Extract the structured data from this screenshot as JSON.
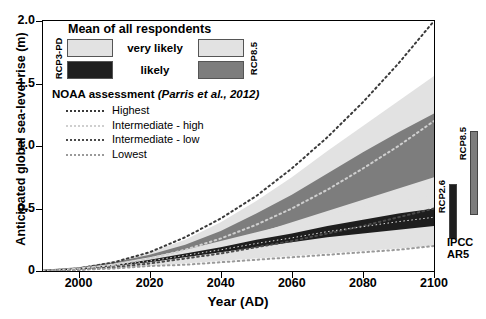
{
  "chart_data": {
    "type": "area",
    "title": "",
    "xlabel": "Year (AD)",
    "ylabel": "Anticipated global sea-level rise (m)",
    "xlim": [
      1990,
      2100
    ],
    "ylim": [
      0,
      2.0
    ],
    "xticks": [
      2000,
      2020,
      2040,
      2060,
      2080,
      2100
    ],
    "yticks": [
      0,
      0.5,
      1.0,
      1.5,
      2.0
    ],
    "ytick_labels": [
      "0",
      "0.5",
      "1.0",
      "1.5",
      "2.0"
    ],
    "xtick_labels": [
      "2000",
      "2020",
      "2040",
      "2060",
      "2080",
      "2100"
    ],
    "grid": false,
    "legend_position": "upper-left",
    "x": [
      1990,
      2000,
      2010,
      2020,
      2030,
      2040,
      2050,
      2060,
      2070,
      2080,
      2090,
      2100
    ],
    "series": [
      {
        "name": "RCP8.5 very likely",
        "kind": "band",
        "color": "#e2e2e2",
        "lower": [
          0.0,
          0.01,
          0.03,
          0.06,
          0.1,
          0.15,
          0.21,
          0.27,
          0.34,
          0.41,
          0.48,
          0.56
        ],
        "upper": [
          0.01,
          0.03,
          0.08,
          0.15,
          0.25,
          0.39,
          0.56,
          0.75,
          0.96,
          1.16,
          1.36,
          1.56
        ]
      },
      {
        "name": "RCP8.5 likely",
        "kind": "band",
        "color": "#7d7d7d",
        "lower": [
          0.0,
          0.02,
          0.05,
          0.09,
          0.15,
          0.22,
          0.3,
          0.39,
          0.48,
          0.57,
          0.66,
          0.75
        ],
        "upper": [
          0.01,
          0.03,
          0.07,
          0.13,
          0.21,
          0.32,
          0.46,
          0.61,
          0.78,
          0.95,
          1.11,
          1.26
        ]
      },
      {
        "name": "RCP3-PD very likely",
        "kind": "band",
        "color": "#e2e2e2",
        "lower": [
          0.0,
          0.01,
          0.02,
          0.04,
          0.06,
          0.08,
          0.1,
          0.12,
          0.14,
          0.16,
          0.18,
          0.2
        ],
        "upper": [
          0.01,
          0.02,
          0.06,
          0.11,
          0.17,
          0.24,
          0.31,
          0.38,
          0.45,
          0.51,
          0.56,
          0.61
        ]
      },
      {
        "name": "RCP3-PD likely",
        "kind": "band",
        "color": "#1e1e1e",
        "lower": [
          0.0,
          0.01,
          0.04,
          0.07,
          0.11,
          0.15,
          0.19,
          0.23,
          0.27,
          0.3,
          0.33,
          0.36
        ],
        "upper": [
          0.01,
          0.02,
          0.05,
          0.09,
          0.14,
          0.19,
          0.25,
          0.3,
          0.36,
          0.41,
          0.46,
          0.5
        ]
      },
      {
        "name": "Highest",
        "kind": "dashed-line",
        "color": "#3a3a3a",
        "values": [
          0.0,
          0.02,
          0.07,
          0.15,
          0.27,
          0.42,
          0.6,
          0.82,
          1.07,
          1.35,
          1.66,
          2.0
        ]
      },
      {
        "name": "Intermediate - high",
        "kind": "dashed-line",
        "color": "#cfcfcf",
        "values": [
          0.0,
          0.02,
          0.05,
          0.1,
          0.17,
          0.26,
          0.37,
          0.5,
          0.65,
          0.82,
          1.0,
          1.2
        ]
      },
      {
        "name": "Intermediate - low",
        "kind": "dashed-line",
        "color": "#4a4a4a",
        "values": [
          0.0,
          0.01,
          0.03,
          0.06,
          0.1,
          0.14,
          0.19,
          0.24,
          0.3,
          0.36,
          0.43,
          0.5
        ]
      },
      {
        "name": "Lowest",
        "kind": "dashed-line",
        "color": "#9a9a9a",
        "values": [
          0.0,
          0.01,
          0.02,
          0.04,
          0.05,
          0.07,
          0.09,
          0.11,
          0.13,
          0.15,
          0.17,
          0.2
        ]
      }
    ],
    "side_bars": [
      {
        "name": "RCP2.6",
        "low": 0.26,
        "high": 0.7,
        "color": "#1e1e1e"
      },
      {
        "name": "RCP8.5",
        "low": 0.45,
        "high": 1.12,
        "color": "#7d7d7d"
      }
    ],
    "annotations": [
      "IPCC AR5"
    ]
  },
  "axes": {
    "y_title": "Anticipated global sea-level rise (m)",
    "x_title": "Year (AD)"
  },
  "legend": {
    "title": "Mean of all respondents",
    "left_scenario": "RCP3-PD",
    "right_scenario": "RCP8.5",
    "rows": [
      {
        "label": "very likely",
        "left_color": "#e2e2e2",
        "right_color": "#e2e2e2"
      },
      {
        "label": "likely",
        "left_color": "#1e1e1e",
        "right_color": "#7d7d7d"
      }
    ]
  },
  "noaa": {
    "title": "NOAA assessment",
    "citation": "(Parris et al., 2012)",
    "items": [
      {
        "label": "Highest",
        "color": "#3a3a3a"
      },
      {
        "label": "Intermediate - high",
        "color": "#cfcfcf"
      },
      {
        "label": "Intermediate - low",
        "color": "#4a4a4a"
      },
      {
        "label": "Lowest",
        "color": "#9a9a9a"
      }
    ]
  },
  "side_panel": {
    "caption_line1": "IPCC",
    "caption_line2": "AR5",
    "bars": [
      {
        "label": "RCP2.6",
        "color": "#1e1e1e"
      },
      {
        "label": "RCP8.5",
        "color": "#7d7d7d"
      }
    ]
  }
}
